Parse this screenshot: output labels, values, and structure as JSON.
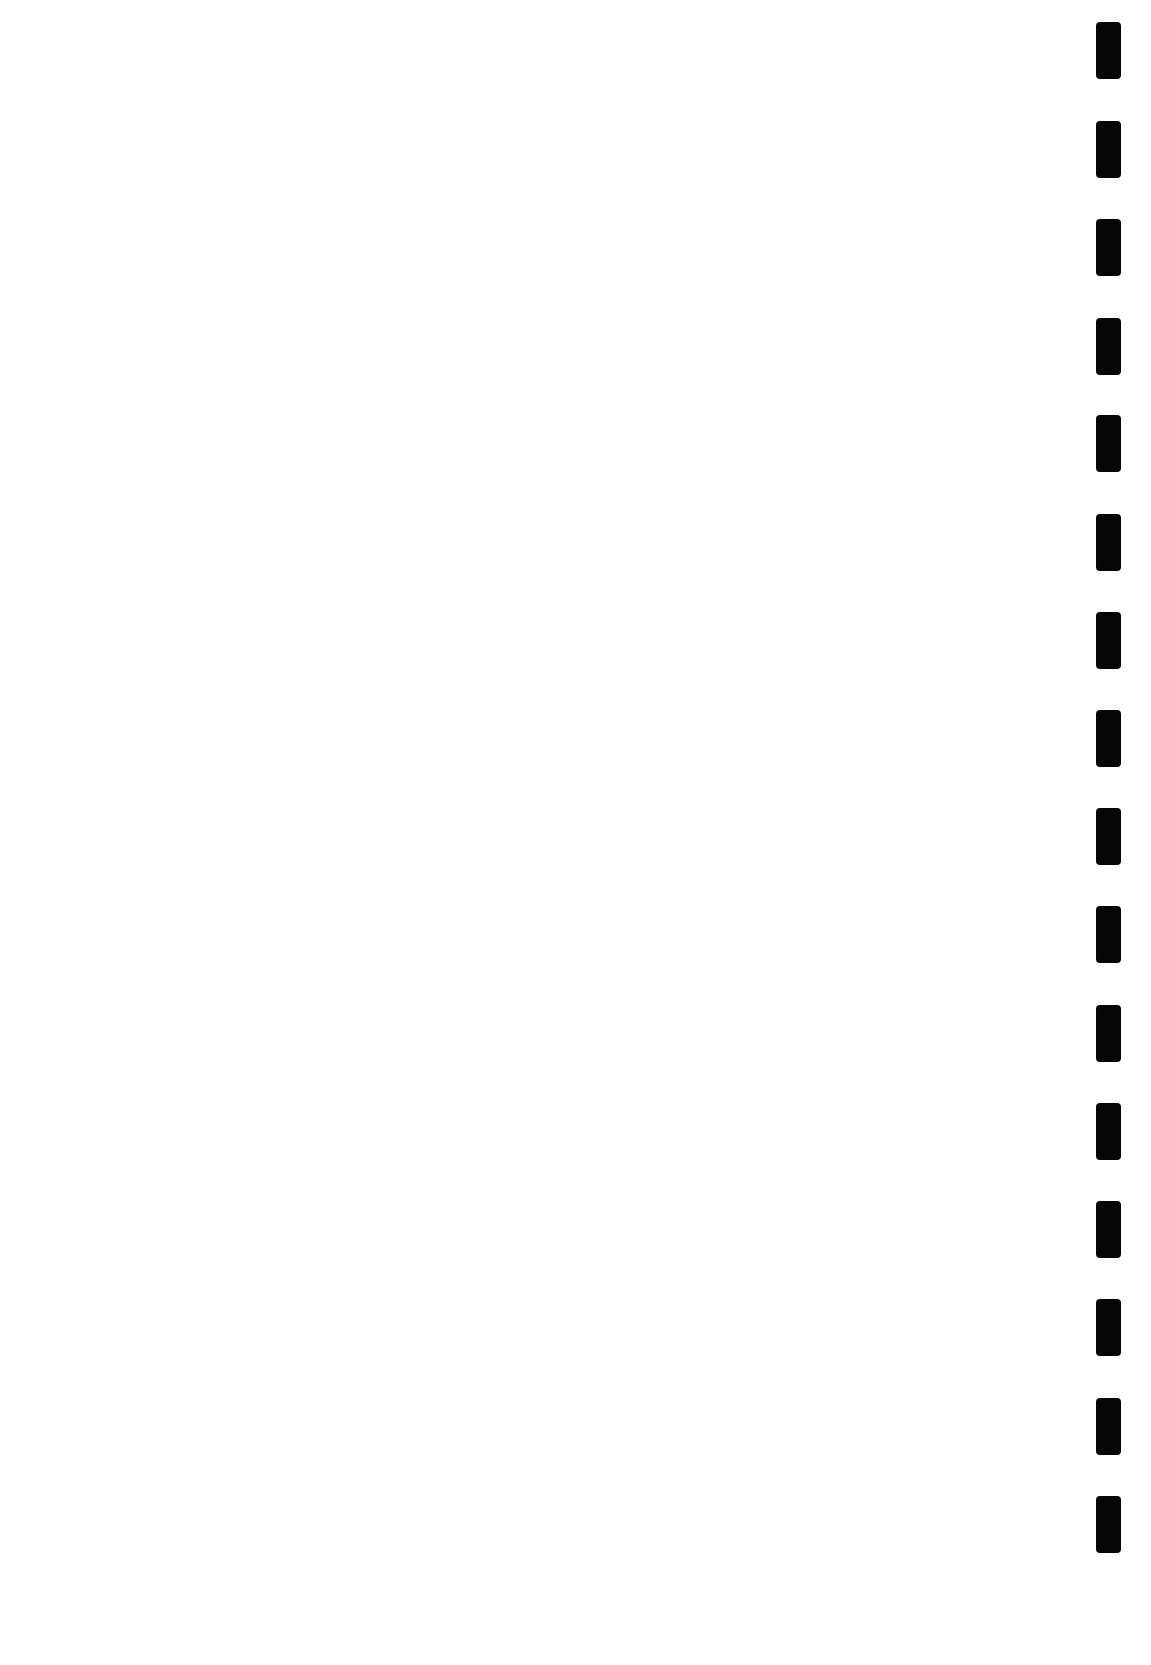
{
  "page": {
    "type": "blank-scanned-page",
    "background_color": "#fefefe",
    "content_text": ""
  },
  "binding_holes": {
    "count": 16,
    "color": "#050505",
    "x": 1096,
    "width": 25,
    "height": 57,
    "tops": [
      22,
      121,
      219,
      318,
      415,
      514,
      612,
      710,
      808,
      906,
      1005,
      1103,
      1201,
      1299,
      1398,
      1496
    ]
  }
}
